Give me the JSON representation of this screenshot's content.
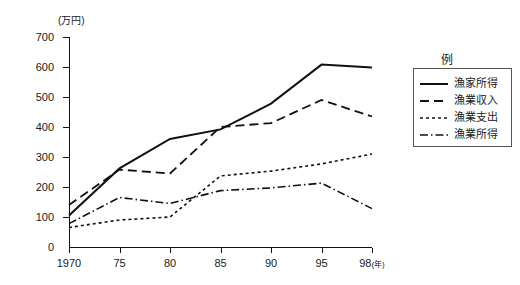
{
  "chart_data": {
    "type": "line",
    "title": "",
    "xlabel": "年",
    "ylabel": "万円",
    "y_unit_label": "(万円)",
    "x_unit_label": "(年)",
    "grid": false,
    "legend_position": "right",
    "x": [
      1970,
      1975,
      1980,
      1985,
      1990,
      1995,
      1998
    ],
    "xtick_labels": [
      "1970",
      "75",
      "80",
      "85",
      "90",
      "95",
      "98"
    ],
    "ytick_labels": [
      "0",
      "100",
      "200",
      "300",
      "400",
      "500",
      "600",
      "700"
    ],
    "ylim": [
      0,
      700
    ],
    "ytick_step": 100,
    "series": [
      {
        "name": "漁家所得",
        "style": "solid",
        "values": [
          105,
          262,
          360,
          392,
          478,
          608,
          598
        ]
      },
      {
        "name": "漁業収入",
        "style": "dashed",
        "values": [
          140,
          258,
          245,
          400,
          413,
          490,
          435
        ]
      },
      {
        "name": "漁業支出",
        "style": "dotted",
        "values": [
          65,
          90,
          100,
          237,
          253,
          277,
          310
        ]
      },
      {
        "name": "漁業所得",
        "style": "dashdot",
        "values": [
          78,
          165,
          145,
          188,
          197,
          213,
          128
        ]
      }
    ]
  },
  "legend": {
    "title": "例",
    "entries": [
      {
        "label": "漁家所得",
        "style": "solid"
      },
      {
        "label": "漁業収入",
        "style": "dashed"
      },
      {
        "label": "漁業支出",
        "style": "dotted"
      },
      {
        "label": "漁業所得",
        "style": "dashdot"
      }
    ]
  },
  "colors": {
    "ink": "#111111",
    "background": "#ffffff"
  }
}
